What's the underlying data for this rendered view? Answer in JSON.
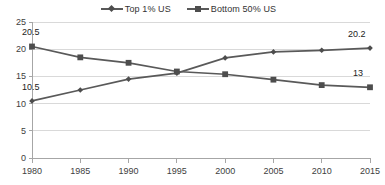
{
  "legend": {
    "position": "top-center",
    "entries": [
      {
        "label": "Top 1% US",
        "marker": "diamond-marker",
        "color": "#595959"
      },
      {
        "label": "Bottom 50% US",
        "marker": "square-marker",
        "color": "#595959"
      }
    ]
  },
  "chart_data": {
    "type": "line",
    "title": "",
    "subtitle": "",
    "xlabel": "",
    "ylabel": "",
    "x": [
      1980,
      1985,
      1990,
      1995,
      2000,
      2005,
      2010,
      2015
    ],
    "categories": [
      "1980",
      "1985",
      "1990",
      "1995",
      "2000",
      "2005",
      "2010",
      "2015"
    ],
    "xlim": [
      1980,
      2015
    ],
    "ylim": [
      0,
      25
    ],
    "yticks": [
      0,
      5,
      10,
      15,
      20,
      25
    ],
    "ytick_labels": [
      "0",
      "5",
      "10",
      "15",
      "20",
      "25"
    ],
    "grid": true,
    "grid_axis": "y",
    "legend_position": "top-center",
    "series": [
      {
        "name": "Top 1% US",
        "color": "#595959",
        "marker": "diamond",
        "values": [
          10.5,
          12.5,
          14.5,
          15.6,
          18.4,
          19.5,
          19.8,
          20.2
        ]
      },
      {
        "name": "Bottom 50% US",
        "color": "#595959",
        "marker": "square",
        "values": [
          20.5,
          18.5,
          17.5,
          15.9,
          15.4,
          14.4,
          13.4,
          13.0
        ]
      }
    ],
    "annotations": [
      {
        "text": "20.5",
        "series": "Bottom 50% US",
        "x": 1980,
        "value": 20.5
      },
      {
        "text": "10.5",
        "series": "Top 1% US",
        "x": 1980,
        "value": 10.5
      },
      {
        "text": "20.2",
        "series": "Top 1% US",
        "x": 2015,
        "value": 20.2
      },
      {
        "text": "13",
        "series": "Bottom 50% US",
        "x": 2015,
        "value": 13.0
      }
    ],
    "colors": {
      "line": "#595959",
      "marker": "#4d4d4d",
      "grid": "#d9d9d9",
      "axis": "#a6a6a6",
      "text": "#404040"
    }
  }
}
